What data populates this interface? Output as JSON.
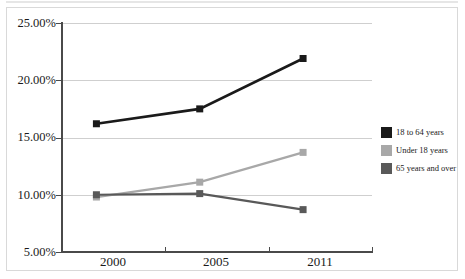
{
  "chart_data": {
    "type": "line",
    "title": "",
    "xlabel": "",
    "ylabel": "",
    "categories": [
      "2000",
      "2005",
      "2011"
    ],
    "ylim": [
      5,
      25
    ],
    "ytick_values": [
      25,
      20,
      15,
      10,
      5
    ],
    "ytick_labels": [
      "25.00%",
      "20.00%",
      "15.00%",
      "10.00%",
      "5.00%"
    ],
    "grid": true,
    "legend_position": "right",
    "series": [
      {
        "name": "18 to 64 years",
        "color": "#1a1a1a",
        "values": [
          16.2,
          17.5,
          21.9
        ],
        "marker": "square"
      },
      {
        "name": "Under 18 years",
        "color": "#a8a8a8",
        "values": [
          9.8,
          11.1,
          13.7
        ],
        "marker": "square"
      },
      {
        "name": "65 years and over",
        "color": "#595959",
        "values": [
          10.0,
          10.1,
          8.7
        ],
        "marker": "square"
      }
    ]
  },
  "legend": {
    "items": [
      {
        "label": "18 to 64 years",
        "color": "#1a1a1a"
      },
      {
        "label": "Under 18 years",
        "color": "#a8a8a8"
      },
      {
        "label": "65 years and over",
        "color": "#595959"
      }
    ]
  },
  "axes": {
    "y_labels": [
      "25.00%",
      "20.00%",
      "15.00%",
      "10.00%",
      "5.00%"
    ],
    "x_labels": [
      "2000",
      "2005",
      "2011"
    ]
  },
  "colors": {
    "frame_border": "#d9d9d9",
    "gridline": "#cfcfcf",
    "axis": "#4a4a4a",
    "background": "#ffffff",
    "text": "#1a1a1a"
  }
}
